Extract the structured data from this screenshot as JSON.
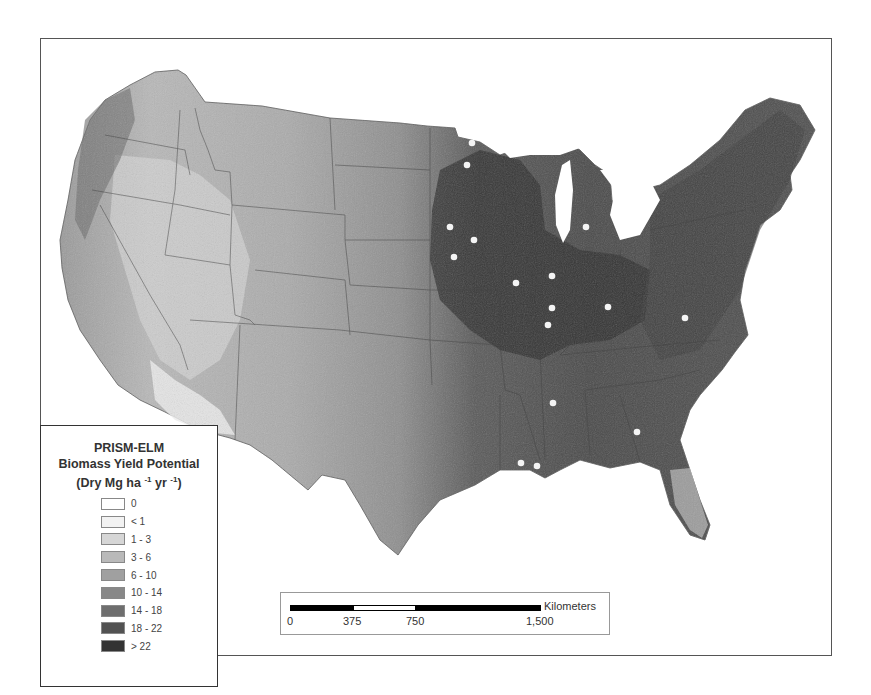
{
  "map": {
    "title": "PRISM-ELM",
    "subtitle": "Biomass Yield Potential",
    "units_prefix": "(Dry Mg ha",
    "units_exp1": "-1",
    "units_mid": " yr",
    "units_exp2": "-1",
    "units_suffix": ")"
  },
  "legend": {
    "items": [
      {
        "label": "0",
        "color": "#ffffff"
      },
      {
        "label": "< 1",
        "color": "#f2f2f2"
      },
      {
        "label": "1 - 3",
        "color": "#d6d6d6"
      },
      {
        "label": "3 - 6",
        "color": "#b9b9b9"
      },
      {
        "label": "6 - 10",
        "color": "#a0a0a0"
      },
      {
        "label": "10 - 14",
        "color": "#888888"
      },
      {
        "label": "14 - 18",
        "color": "#6e6e6e"
      },
      {
        "label": "18 - 22",
        "color": "#525252"
      },
      {
        "label": "> 22",
        "color": "#333333"
      }
    ]
  },
  "scale_bar": {
    "unit": "Kilometers",
    "ticks": [
      "0",
      "375",
      "750",
      "1,500"
    ]
  },
  "sites": [
    {
      "x": 450,
      "y": 227
    },
    {
      "x": 474,
      "y": 240
    },
    {
      "x": 454,
      "y": 257
    },
    {
      "x": 586,
      "y": 227
    },
    {
      "x": 552,
      "y": 276
    },
    {
      "x": 516,
      "y": 283
    },
    {
      "x": 552,
      "y": 308
    },
    {
      "x": 608,
      "y": 307
    },
    {
      "x": 548,
      "y": 325
    },
    {
      "x": 685,
      "y": 318
    },
    {
      "x": 553,
      "y": 403
    },
    {
      "x": 637,
      "y": 432
    },
    {
      "x": 521,
      "y": 463
    },
    {
      "x": 537,
      "y": 466
    },
    {
      "x": 467,
      "y": 165
    },
    {
      "x": 472,
      "y": 143
    }
  ]
}
